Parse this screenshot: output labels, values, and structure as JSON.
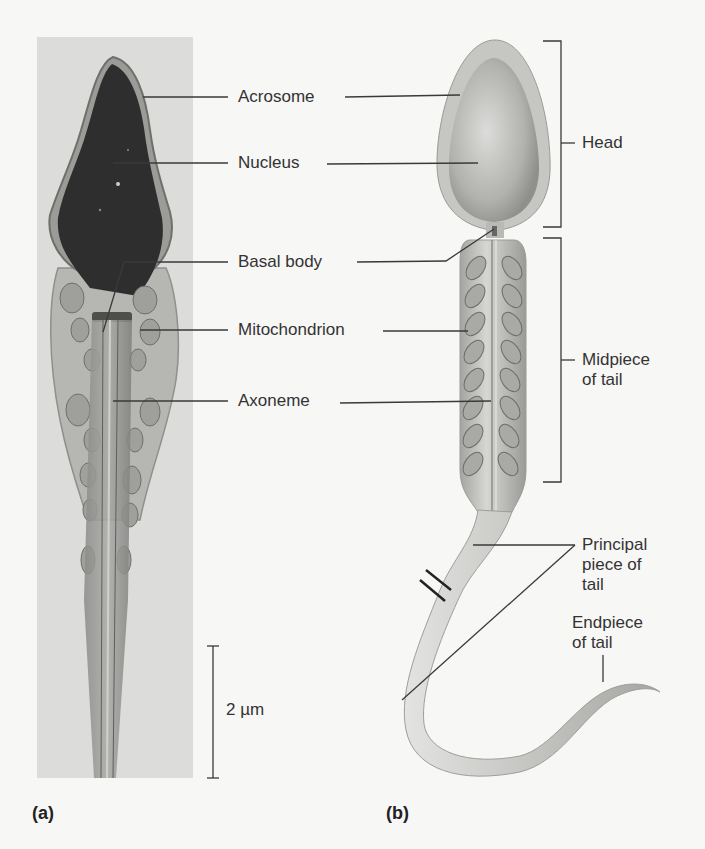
{
  "figure": {
    "panels": [
      {
        "id": "a",
        "letter": "(a)",
        "kind": "micrograph"
      },
      {
        "id": "b",
        "letter": "(b)",
        "kind": "illustration"
      }
    ],
    "center_labels": [
      {
        "key": "acrosome",
        "text": "Acrosome"
      },
      {
        "key": "nucleus",
        "text": "Nucleus"
      },
      {
        "key": "basal_body",
        "text": "Basal body"
      },
      {
        "key": "mitochondrion",
        "text": "Mitochondrion"
      },
      {
        "key": "axoneme",
        "text": "Axoneme"
      }
    ],
    "region_labels": {
      "head": "Head",
      "midpiece_line1": "Midpiece",
      "midpiece_line2": "of tail",
      "principal_line1": "Principal",
      "principal_line2": "piece of",
      "principal_line3": "tail",
      "endpiece_line1": "Endpiece",
      "endpiece_line2": "of tail"
    },
    "scale_bar": {
      "text": "2 µm"
    }
  },
  "colors": {
    "background": "#f7f7f6",
    "photo_background": "#dcdcda",
    "nucleus_dark": "#2e2e2e",
    "illustration_body": "#c9c9c7",
    "leader_line": "#3a3a3a"
  }
}
